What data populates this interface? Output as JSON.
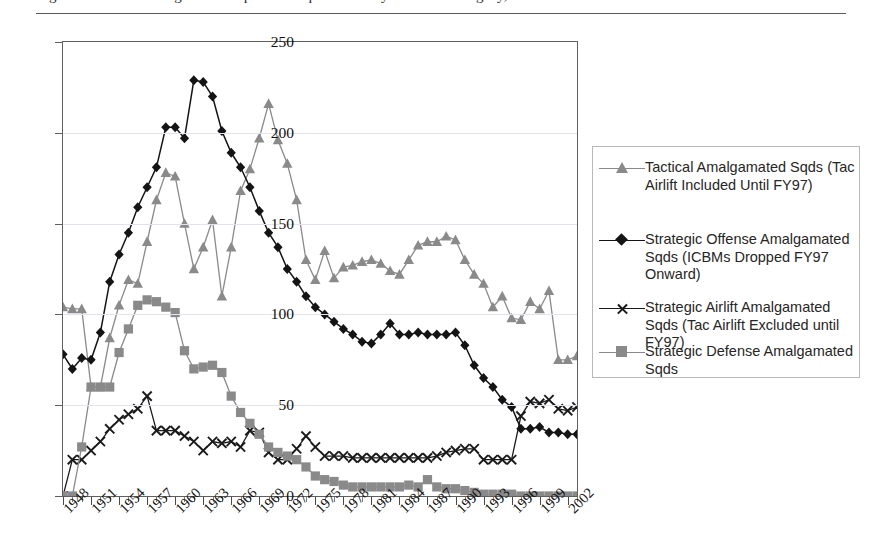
{
  "page": {
    "running_head_partial": "Figure 5. USAF Amalgamated Squadron Equivalents by Mission Category, FY1948-FY2003"
  },
  "legend": {
    "position": "right",
    "items": [
      {
        "label": "Tactical Amalgamated Sqds (Tac Airlift Included Until FY97)",
        "marker": "triangle-marker",
        "color": "#8a8a8a"
      },
      {
        "label": "Strategic Offense Amalgamated Sqds (ICBMs Dropped FY97 Onward)",
        "marker": "diamond-marker",
        "color": "#141414"
      },
      {
        "label": "Strategic Airlift Amalgamated Sqds (Tac Airlift Excluded until FY97)",
        "marker": "x-marker",
        "color": "#1a1a1a"
      },
      {
        "label": "Strategic Defense Amalgamated Sqds",
        "marker": "square-marker",
        "color": "#8a8a8a"
      }
    ]
  },
  "chart_data": {
    "type": "line",
    "title": "",
    "xlabel": "",
    "ylabel": "",
    "ylim": [
      0,
      250
    ],
    "yticks": [
      0,
      50,
      100,
      150,
      200,
      250
    ],
    "grid": true,
    "xlim": [
      1948,
      2003
    ],
    "x": [
      1948,
      1949,
      1950,
      1951,
      1952,
      1953,
      1954,
      1955,
      1956,
      1957,
      1958,
      1959,
      1960,
      1961,
      1962,
      1963,
      1964,
      1965,
      1966,
      1967,
      1968,
      1969,
      1970,
      1971,
      1972,
      1973,
      1974,
      1975,
      1976,
      1977,
      1978,
      1979,
      1980,
      1981,
      1982,
      1983,
      1984,
      1985,
      1986,
      1987,
      1988,
      1989,
      1990,
      1991,
      1992,
      1993,
      1994,
      1995,
      1996,
      1997,
      1998,
      1999,
      2000,
      2001,
      2002,
      2003
    ],
    "xtick_labels": [
      "1948",
      "1951",
      "1954",
      "1957",
      "1960",
      "1963",
      "1966",
      "1969",
      "1972",
      "1975",
      "1978",
      "1981",
      "1984",
      "1987",
      "1990",
      "1993",
      "1996",
      "1999",
      "2002"
    ],
    "xtick_values": [
      1948,
      1951,
      1954,
      1957,
      1960,
      1963,
      1966,
      1969,
      1972,
      1975,
      1978,
      1981,
      1984,
      1987,
      1990,
      1993,
      1996,
      1999,
      2002
    ],
    "series": [
      {
        "name": "Tactical Amalgamated Sqds (Tac Airlift Included Until FY97)",
        "marker": "triangle",
        "color": "#8a8a8a",
        "values": [
          104,
          103,
          103,
          60,
          60,
          87,
          105,
          119,
          117,
          140,
          163,
          178,
          176,
          150,
          125,
          137,
          152,
          110,
          137,
          168,
          180,
          197,
          216,
          196,
          183,
          163,
          130,
          119,
          135,
          120,
          126,
          127,
          129,
          130,
          128,
          124,
          122,
          130,
          138,
          140,
          140,
          143,
          141,
          130,
          122,
          117,
          104,
          110,
          98,
          97,
          107,
          103,
          113,
          75,
          75,
          77
        ]
      },
      {
        "name": "Strategic Offense Amalgamated Sqds (ICBMs Dropped FY97 Onward)",
        "marker": "diamond",
        "color": "#141414",
        "values": [
          78,
          70,
          76,
          75,
          90,
          118,
          133,
          145,
          159,
          170,
          181,
          203,
          203,
          197,
          229,
          228,
          220,
          201,
          189,
          181,
          170,
          157,
          145,
          137,
          125,
          118,
          110,
          104,
          100,
          96,
          92,
          89,
          85,
          84,
          89,
          95,
          89,
          89,
          90,
          89,
          89,
          89,
          90,
          83,
          72,
          65,
          60,
          53,
          49,
          37,
          37,
          38,
          35,
          35,
          34,
          34
        ]
      },
      {
        "name": "Strategic Airlift Amalgamated Sqds (Tac Airlift Excluded until FY97)",
        "marker": "x",
        "color": "#1a1a1a",
        "values": [
          0,
          20,
          20,
          25,
          30,
          37,
          42,
          45,
          48,
          55,
          36,
          36,
          36,
          33,
          30,
          25,
          30,
          29,
          30,
          27,
          36,
          35,
          24,
          20,
          20,
          26,
          33,
          27,
          22,
          22,
          22,
          21,
          21,
          21,
          21,
          21,
          21,
          21,
          21,
          21,
          22,
          24,
          25,
          26,
          26,
          20,
          20,
          20,
          20,
          44,
          52,
          51,
          53,
          48,
          47,
          49
        ]
      },
      {
        "name": "Strategic Defense Amalgamated Sqds",
        "marker": "square",
        "color": "#8a8a8a",
        "values": [
          0,
          0,
          27,
          60,
          60,
          60,
          79,
          92,
          105,
          108,
          107,
          104,
          101,
          80,
          70,
          71,
          72,
          68,
          55,
          46,
          40,
          34,
          27,
          24,
          22,
          20,
          16,
          11,
          9,
          8,
          6,
          5,
          5,
          5,
          5,
          5,
          5,
          6,
          5,
          9,
          5,
          4,
          4,
          3,
          2,
          1,
          1,
          1,
          1,
          0,
          0,
          0,
          0,
          0,
          0,
          0
        ]
      }
    ]
  }
}
